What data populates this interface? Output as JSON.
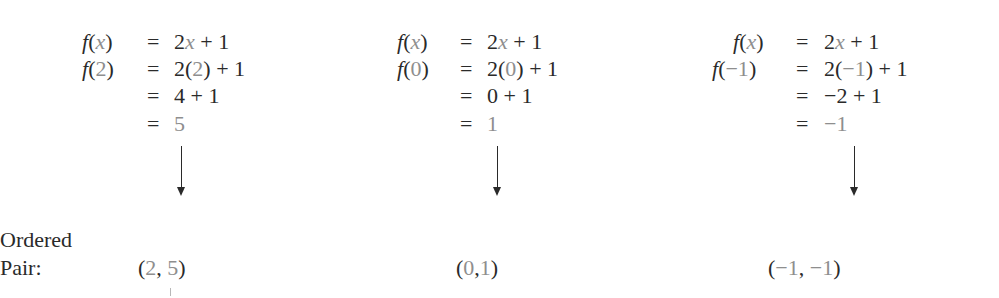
{
  "function_definition": "f(x) = 2x + 1",
  "columns": [
    {
      "input": "2",
      "rows": [
        {
          "lhs_fn": "f",
          "lhs_arg": "x",
          "rhs_parts": [
            "2",
            "x",
            " + 1"
          ]
        },
        {
          "lhs_fn": "f",
          "lhs_arg": "2",
          "rhs_parts": [
            "2(",
            "2",
            ") + 1"
          ]
        },
        {
          "rhs": "4 + 1"
        },
        {
          "rhs_result": "5"
        }
      ],
      "ordered_pair": {
        "x": "2",
        "y": "5"
      }
    },
    {
      "input": "0",
      "rows": [
        {
          "lhs_fn": "f",
          "lhs_arg": "x",
          "rhs_parts": [
            "2",
            "x",
            " + 1"
          ]
        },
        {
          "lhs_fn": "f",
          "lhs_arg": "0",
          "rhs_parts": [
            "2(",
            "0",
            ") + 1"
          ]
        },
        {
          "rhs": "0 + 1"
        },
        {
          "rhs_result": "1"
        }
      ],
      "ordered_pair": {
        "x": "0",
        "y": "1"
      }
    },
    {
      "input": "−1",
      "rows": [
        {
          "lhs_fn": "f",
          "lhs_arg": "x",
          "rhs_parts": [
            "2",
            "x",
            " + 1"
          ]
        },
        {
          "lhs_fn": "f",
          "lhs_arg": "−1",
          "rhs_parts": [
            "2(",
            "−1",
            ") + 1"
          ]
        },
        {
          "rhs": "−2 + 1"
        },
        {
          "rhs_result": "−1"
        }
      ],
      "ordered_pair": {
        "x": "−1",
        "y": "−1"
      }
    }
  ],
  "labels": {
    "ordered_line1": "Ordered",
    "ordered_line2": "Pair:"
  },
  "symbols": {
    "equals": "=",
    "open_paren": "(",
    "close_paren": ")",
    "comma": ","
  },
  "colors": {
    "text": "#2a2a2a",
    "highlight": "#8e8e8e"
  }
}
